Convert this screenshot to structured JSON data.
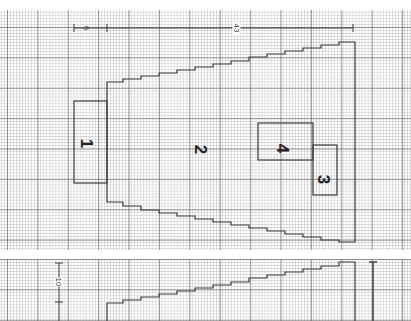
{
  "diagram": {
    "type": "floor-plan-on-graph-paper",
    "top_panel": {
      "dimensions": [
        {
          "id": "dim-left",
          "label": "6"
        },
        {
          "id": "dim-top",
          "label": "43"
        }
      ],
      "regions": [
        {
          "id": "1",
          "label": "1"
        },
        {
          "id": "2",
          "label": "2"
        },
        {
          "id": "3",
          "label": "3"
        },
        {
          "id": "4",
          "label": "4"
        }
      ]
    },
    "bottom_panel": {
      "dimensions": [
        {
          "id": "dim-bottom",
          "label": "10"
        }
      ]
    },
    "colors": {
      "line": "#3a3a3a",
      "grid_major": "#808080",
      "grid_minor": "#b8b8b8",
      "paper": "#ffffff"
    }
  }
}
